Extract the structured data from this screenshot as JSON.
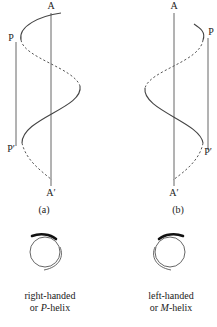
{
  "figure": {
    "panels": [
      {
        "id": "a",
        "caption": "(a)",
        "axis_top_label": "A",
        "axis_bottom_label": "A′",
        "side_top_label": "P",
        "side_bottom_label": "P′",
        "handedness": "right"
      },
      {
        "id": "b",
        "caption": "(b)",
        "axis_top_label": "A",
        "axis_bottom_label": "A′",
        "side_top_label": "P",
        "side_bottom_label": "P′",
        "handedness": "left"
      }
    ],
    "legends": [
      {
        "line1": "right-handed",
        "line2_prefix": "or ",
        "line2_italic": "P",
        "line2_suffix": "-helix",
        "icon": "clockwise-spiral-icon"
      },
      {
        "line1": "left-handed",
        "line2_prefix": "or ",
        "line2_italic": "M",
        "line2_suffix": "-helix",
        "icon": "counterclockwise-spiral-icon"
      }
    ]
  }
}
